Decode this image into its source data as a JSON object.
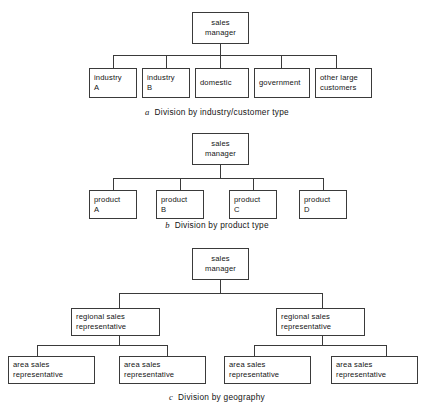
{
  "document": {
    "title": "Sales organisation structures",
    "figure_count": 3,
    "ink_color": "#3a3a3a",
    "background_color": "#ffffff"
  },
  "diagrams": [
    {
      "id": "a",
      "index_label": "a",
      "caption": "Division by industry/customer type",
      "root": {
        "label": "sales\nmanager"
      },
      "children": [
        {
          "label": "industry\nA"
        },
        {
          "label": "industry\nB"
        },
        {
          "label": "domestic"
        },
        {
          "label": "government"
        },
        {
          "label": "other large\ncustomers"
        }
      ]
    },
    {
      "id": "b",
      "index_label": "b",
      "caption": "Division by product type",
      "root": {
        "label": "sales\nmanager"
      },
      "children": [
        {
          "label": "product\nA"
        },
        {
          "label": "product\nB"
        },
        {
          "label": "product\nC"
        },
        {
          "label": "product\nD"
        }
      ]
    },
    {
      "id": "c",
      "index_label": "c",
      "caption": "Division by geography",
      "root": {
        "label": "sales\nmanager"
      },
      "regional": [
        {
          "label": "regional sales\nrepresentative"
        },
        {
          "label": "regional sales\nrepresentative"
        }
      ],
      "areas": [
        {
          "label": "area sales\nrepresentative"
        },
        {
          "label": "area sales\nrepresentative"
        },
        {
          "label": "area sales\nrepresentative"
        },
        {
          "label": "area sales\nrepresentative"
        }
      ]
    }
  ]
}
